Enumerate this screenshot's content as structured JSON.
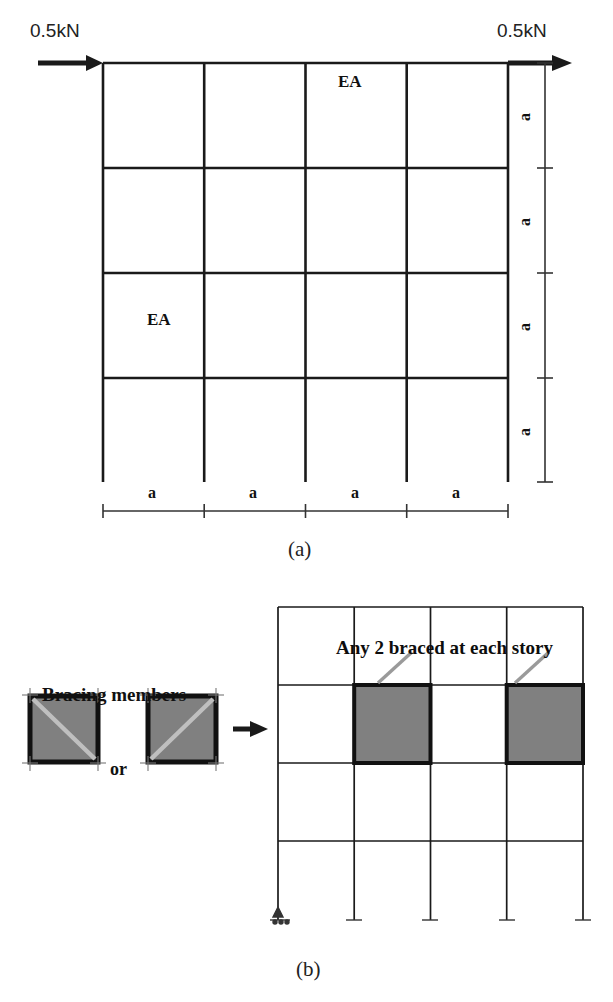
{
  "figure": {
    "panel_a": {
      "caption": "(a)",
      "load_left_label": "0.5kN",
      "load_right_label": "0.5kN",
      "member_label_top": "EA",
      "member_label_left": "EA",
      "bay_dim_labels": [
        "a",
        "a",
        "a",
        "a"
      ],
      "story_dim_labels": [
        "a",
        "a",
        "a",
        "a"
      ],
      "grid": {
        "bays": 4,
        "stories": 4
      }
    },
    "panel_b": {
      "caption": "(b)",
      "bracing_title": "Bracing members",
      "or_label": "or",
      "annotation": "Any 2 braced at each story",
      "grid": {
        "bays": 4,
        "stories": 4
      },
      "braced_bays": [
        2,
        4
      ],
      "braced_story": 2,
      "brace_options": [
        {
          "name": "diagonal-down-brace",
          "direction": "top-left-to-bottom-right"
        },
        {
          "name": "diagonal-up-brace",
          "direction": "bottom-left-to-top-right"
        }
      ]
    }
  },
  "colors": {
    "line": "#1a1a1a",
    "panel_fill": "#808080",
    "panel_stroke": "#111111",
    "brace_line": "#bfbfbf",
    "leader_line": "#9a9a9a",
    "dim_line": "#333333"
  }
}
